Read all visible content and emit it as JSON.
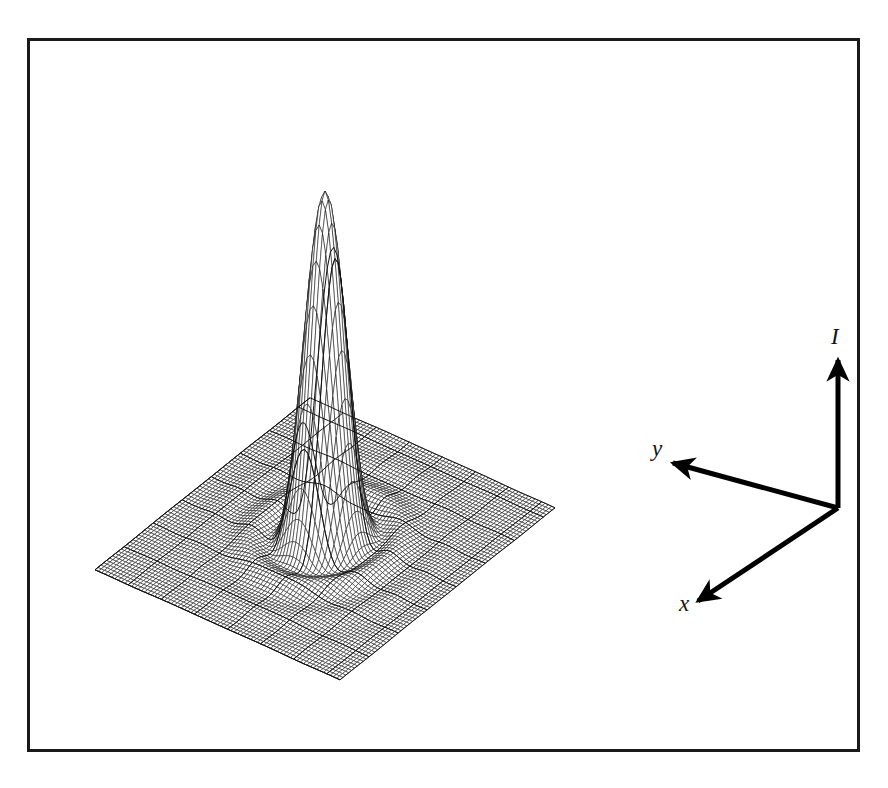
{
  "figure": {
    "kind": "3d-wireframe-surface-plot",
    "background_color": "#ffffff",
    "frame": {
      "border_color": "#1a1a1a",
      "border_width": 3,
      "x": 27,
      "y": 38,
      "width": 833,
      "height": 714
    }
  },
  "axes": {
    "origin": {
      "x": 838,
      "y": 508
    },
    "color": "#000000",
    "line_width": 5,
    "items": [
      {
        "name": "I",
        "label": "I",
        "tip": {
          "x": 838,
          "y": 360
        },
        "label_pos": {
          "x": 831,
          "y": 325
        }
      },
      {
        "name": "y",
        "label": "y",
        "tip": {
          "x": 673,
          "y": 463
        },
        "label_pos": {
          "x": 652,
          "y": 437
        }
      },
      {
        "name": "x",
        "label": "x",
        "tip": {
          "x": 698,
          "y": 601
        },
        "label_pos": {
          "x": 679,
          "y": 592
        }
      }
    ]
  },
  "chart_data": {
    "type": "surface",
    "title": "",
    "xlabel": "x",
    "ylabel": "y",
    "zlabel": "I",
    "function": "airy",
    "formula": "I(r) = (2*J1(k*r)/(k*r))^2",
    "peak_value": 1.0,
    "peak_screen": {
      "x": 415,
      "y": 133
    },
    "ring_maxima": [
      0.0175,
      0.0042
    ],
    "ring_radii_normalized": [
      0.0,
      0.305,
      0.56
    ],
    "zero_radii_normalized": [
      0.175,
      0.32,
      0.465
    ],
    "grid": {
      "u_divisions": 74,
      "v_divisions": 74,
      "accent_every": 10
    },
    "axis_ranges": {
      "x": [
        -1,
        1
      ],
      "y": [
        -1,
        1
      ],
      "I": [
        0,
        1
      ]
    },
    "projection": {
      "plane_corners": {
        "left": {
          "x": 95,
          "y": 570
        },
        "back": {
          "x": 310,
          "y": 398
        },
        "right": {
          "x": 790,
          "y": 510
        },
        "front": {
          "x": 340,
          "y": 680
        }
      },
      "height_scale": 348
    },
    "style": {
      "mesh_color": "#111111",
      "mesh_width": 0.55,
      "accent_width": 1.0,
      "fill": "#ffffff",
      "legend": "none",
      "gridlines": "mesh-only"
    }
  }
}
